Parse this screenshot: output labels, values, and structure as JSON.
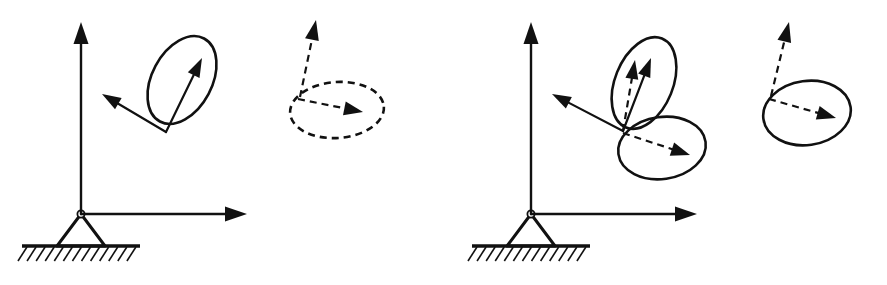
{
  "figure": {
    "title": "Rigid body rotation and precession about a fixed pinned support",
    "background_color": "#ffffff",
    "ink_color": "#111111",
    "width": 887,
    "height": 285
  },
  "panels": [
    {
      "id": "panel-left",
      "name": "left-panel",
      "label": "Left panel: single spin cone with precession circle",
      "support": {
        "name": "pin-support-left",
        "type": "pinned-support",
        "pivot_x": 81,
        "pivot_y": 214,
        "pivot_radius": 3.6,
        "triangle_half_width": 24,
        "triangle_height": 32,
        "ground_y": 246,
        "ground_x1": 22,
        "ground_x2": 140,
        "hatch_count": 13,
        "hatch_length": 15,
        "hatch_slope_dx": 9,
        "hatch_slope_dy": 14
      },
      "axes": [
        {
          "name": "vertical-axis-left",
          "label": "vertical axis",
          "x1": 81,
          "y1": 214,
          "x2": 81,
          "y2": 22,
          "style": "solid",
          "arrow": "end",
          "width": 2.4
        },
        {
          "name": "horizontal-axis-left",
          "label": "horizontal axis",
          "x1": 81,
          "y1": 214,
          "x2": 247,
          "y2": 214,
          "style": "solid",
          "arrow": "end",
          "width": 2.4
        }
      ],
      "ellipses": [
        {
          "name": "spin-cone-ellipse-left",
          "label": "spin cone base ellipse",
          "cx": 182,
          "cy": 80,
          "rx": 30,
          "ry": 47,
          "rotation": 28,
          "style": "solid",
          "width": 2.6
        },
        {
          "name": "precession-circle-left",
          "label": "precession path ellipse",
          "cx": 337,
          "cy": 110,
          "rx": 47,
          "ry": 28,
          "rotation": -4,
          "style": "dashed",
          "width": 2.6,
          "dash": "7 5"
        }
      ],
      "vectors": [
        {
          "name": "spin-vector-left",
          "label": "spin angular velocity vector",
          "x1": 166,
          "y1": 132,
          "x2": 202,
          "y2": 58,
          "style": "solid",
          "width": 2.2,
          "head_length": 19,
          "head_half_width": 6.5
        },
        {
          "name": "reaction-vector-left",
          "label": "transverse vector to upper left",
          "x1": 166,
          "y1": 132,
          "x2": 102,
          "y2": 94,
          "style": "solid",
          "width": 2.2,
          "head_length": 19,
          "head_half_width": 6.5
        },
        {
          "name": "precession-axis-vector-left",
          "label": "precession axis vector",
          "x1": 300,
          "y1": 97,
          "x2": 316,
          "y2": 20,
          "style": "dashed",
          "width": 2.2,
          "dash": "7 5",
          "head_length": 20,
          "head_half_width": 7
        },
        {
          "name": "precession-radius-vector-left",
          "label": "precession radius vector",
          "x1": 298,
          "y1": 99,
          "x2": 363,
          "y2": 112,
          "style": "dashed",
          "width": 2.2,
          "dash": "7 5",
          "head_length": 19,
          "head_half_width": 7
        }
      ]
    },
    {
      "id": "panel-right",
      "name": "right-panel",
      "label": "Right panel: two cones with resultant vector and precession ellipse",
      "support": {
        "name": "pin-support-right",
        "type": "pinned-support",
        "pivot_x": 531,
        "pivot_y": 214,
        "pivot_radius": 3.6,
        "triangle_half_width": 24,
        "triangle_height": 32,
        "ground_y": 246,
        "ground_x1": 472,
        "ground_x2": 590,
        "hatch_count": 13,
        "hatch_length": 15,
        "hatch_slope_dx": 9,
        "hatch_slope_dy": 14
      },
      "axes": [
        {
          "name": "vertical-axis-right",
          "label": "vertical axis",
          "x1": 531,
          "y1": 214,
          "x2": 531,
          "y2": 22,
          "style": "solid",
          "arrow": "end",
          "width": 2.4
        },
        {
          "name": "horizontal-axis-right",
          "label": "horizontal axis",
          "x1": 531,
          "y1": 214,
          "x2": 697,
          "y2": 214,
          "style": "solid",
          "arrow": "end",
          "width": 2.4
        }
      ],
      "ellipses": [
        {
          "name": "upper-cone-ellipse-right",
          "label": "upper spin cone ellipse",
          "cx": 644,
          "cy": 83,
          "rx": 29,
          "ry": 48,
          "rotation": 22,
          "style": "solid",
          "width": 2.6
        },
        {
          "name": "lower-cone-ellipse-right",
          "label": "lower precession cone ellipse",
          "cx": 662,
          "cy": 148,
          "rx": 44,
          "ry": 31,
          "rotation": -8,
          "style": "solid",
          "width": 2.6
        },
        {
          "name": "precession-ellipse-far-right",
          "label": "resultant precession ellipse",
          "cx": 807,
          "cy": 113,
          "rx": 44,
          "ry": 32,
          "rotation": -8,
          "style": "solid",
          "width": 2.6
        }
      ],
      "vectors": [
        {
          "name": "resultant-vector-right",
          "label": "resultant angular momentum vector",
          "x1": 623,
          "y1": 131,
          "x2": 651,
          "y2": 58,
          "style": "solid",
          "width": 2.2,
          "head_length": 19,
          "head_half_width": 6.5
        },
        {
          "name": "spin-component-vector-right",
          "label": "spin component vector (dashed)",
          "x1": 623,
          "y1": 131,
          "x2": 635,
          "y2": 60,
          "style": "dashed",
          "width": 2.2,
          "dash": "7 5",
          "head_length": 19,
          "head_half_width": 6.5
        },
        {
          "name": "transverse-vector-right",
          "label": "transverse vector to upper left",
          "x1": 623,
          "y1": 131,
          "x2": 552,
          "y2": 94,
          "style": "solid",
          "width": 2.2,
          "head_length": 19,
          "head_half_width": 6.5
        },
        {
          "name": "precession-component-vector-right",
          "label": "precession component vector (dashed)",
          "x1": 623,
          "y1": 133,
          "x2": 690,
          "y2": 155,
          "style": "dashed",
          "width": 2.2,
          "dash": "7 5",
          "head_length": 19,
          "head_half_width": 7
        },
        {
          "name": "precession-axis-vector-far-right",
          "label": "precession axis vector",
          "x1": 771,
          "y1": 96,
          "x2": 789,
          "y2": 22,
          "style": "dashed",
          "width": 2.2,
          "dash": "7 5",
          "head_length": 20,
          "head_half_width": 7
        },
        {
          "name": "precession-radius-vector-far-right",
          "label": "precession radius vector",
          "x1": 769,
          "y1": 99,
          "x2": 836,
          "y2": 118,
          "style": "dashed",
          "width": 2.2,
          "dash": "7 5",
          "head_length": 19,
          "head_half_width": 7
        }
      ]
    }
  ]
}
